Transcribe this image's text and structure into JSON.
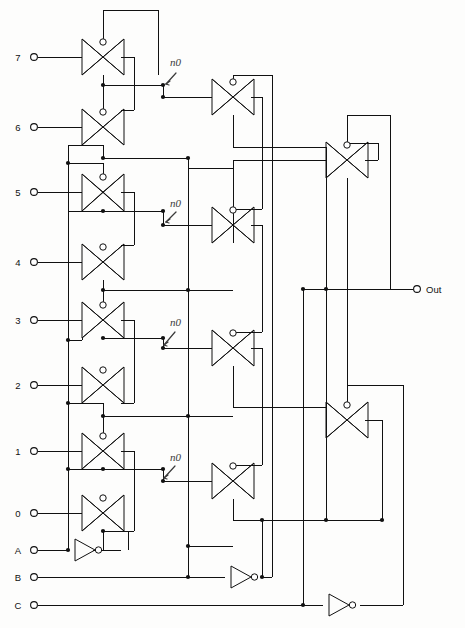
{
  "diagram": {
    "background_color": "#fdfdfc",
    "line_color": "#111111",
    "note_color": "#3a3a3a"
  },
  "inputs": [
    {
      "label": "7",
      "x": 31,
      "y": 57
    },
    {
      "label": "6",
      "x": 31,
      "y": 127
    },
    {
      "label": "5",
      "x": 31,
      "y": 192
    },
    {
      "label": "4",
      "x": 31,
      "y": 262
    },
    {
      "label": "3",
      "x": 31,
      "y": 320
    },
    {
      "label": "2",
      "x": 31,
      "y": 385
    },
    {
      "label": "1",
      "x": 31,
      "y": 451
    },
    {
      "label": "0",
      "x": 31,
      "y": 513
    },
    {
      "label": "A",
      "x": 31,
      "y": 550
    },
    {
      "label": "B",
      "x": 31,
      "y": 577
    },
    {
      "label": "C",
      "x": 31,
      "y": 605
    }
  ],
  "outputs": [
    {
      "label": "Out",
      "x": 421,
      "y": 289
    }
  ],
  "annotations": [
    {
      "text": "n0",
      "x": 175,
      "y": 63
    },
    {
      "text": "n0",
      "x": 175,
      "y": 204
    },
    {
      "text": "n0",
      "x": 175,
      "y": 323
    },
    {
      "text": "n0",
      "x": 175,
      "y": 458
    }
  ],
  "transmission_gates": [
    {
      "name": "tg-in7",
      "cx": 103,
      "cy": 57,
      "stage": 1,
      "selects": "7"
    },
    {
      "name": "tg-in6",
      "cx": 103,
      "cy": 127,
      "stage": 1,
      "selects": "6"
    },
    {
      "name": "tg-in5",
      "cx": 103,
      "cy": 192,
      "stage": 1,
      "selects": "5"
    },
    {
      "name": "tg-in4",
      "cx": 103,
      "cy": 262,
      "stage": 1,
      "selects": "4"
    },
    {
      "name": "tg-in3",
      "cx": 103,
      "cy": 320,
      "stage": 1,
      "selects": "3"
    },
    {
      "name": "tg-in2",
      "cx": 103,
      "cy": 385,
      "stage": 1,
      "selects": "2"
    },
    {
      "name": "tg-in1",
      "cx": 103,
      "cy": 451,
      "stage": 1,
      "selects": "1"
    },
    {
      "name": "tg-in0",
      "cx": 103,
      "cy": 513,
      "stage": 1,
      "selects": "0"
    },
    {
      "name": "tg-mid-a",
      "cx": 233,
      "cy": 97,
      "stage": 2,
      "selects": "n0-7-6"
    },
    {
      "name": "tg-mid-b",
      "cx": 233,
      "cy": 225,
      "stage": 2,
      "selects": "n0-5-4"
    },
    {
      "name": "tg-mid-c",
      "cx": 233,
      "cy": 348,
      "stage": 2,
      "selects": "n0-3-2"
    },
    {
      "name": "tg-mid-d",
      "cx": 233,
      "cy": 481,
      "stage": 2,
      "selects": "n0-1-0"
    },
    {
      "name": "tg-out-top",
      "cx": 347,
      "cy": 160,
      "stage": 3,
      "selects": "upper"
    },
    {
      "name": "tg-out-bot",
      "cx": 347,
      "cy": 420,
      "stage": 3,
      "selects": "lower"
    }
  ],
  "inverters": [
    {
      "name": "inverter-a",
      "x": 75,
      "y": 550,
      "input": "A"
    },
    {
      "name": "inverter-b",
      "x": 231,
      "y": 577,
      "input": "B"
    },
    {
      "name": "inverter-c",
      "x": 329,
      "y": 605,
      "input": "C"
    }
  ],
  "legend": {
    "gate_symbol": "transmission-gate",
    "inverter_symbol": "inverter",
    "terminal_symbol": "open-circle-terminal",
    "junction_symbol": "solid-dot-junction"
  }
}
